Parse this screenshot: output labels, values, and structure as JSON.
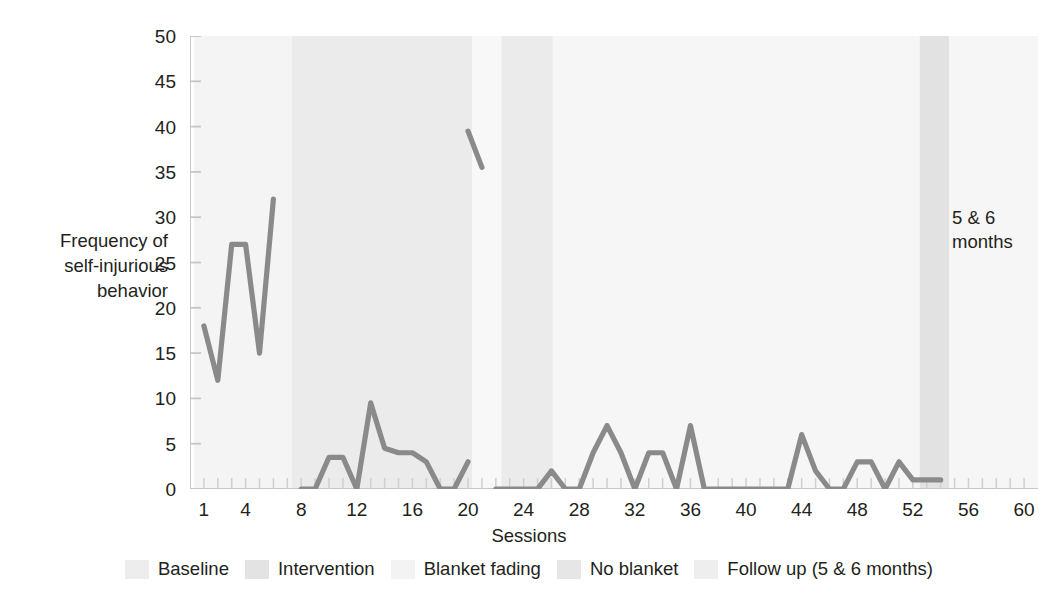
{
  "chart_data": {
    "type": "line",
    "title": "",
    "xlabel": "Sessions",
    "ylabel": "Frequency of\nself-injurious\nbehavior",
    "xlim": [
      0,
      61
    ],
    "ylim": [
      0,
      50
    ],
    "grid": false,
    "x_ticks": [
      1,
      4,
      8,
      12,
      16,
      20,
      24,
      28,
      32,
      36,
      40,
      44,
      48,
      52,
      56,
      60
    ],
    "y_ticks": [
      0,
      5,
      10,
      15,
      20,
      25,
      30,
      35,
      40,
      45,
      50
    ],
    "line_color": "#8a8a8a",
    "series": [
      {
        "name": "Baseline",
        "x": [
          1,
          2,
          3,
          4,
          5,
          6
        ],
        "values": [
          18,
          12,
          27,
          27,
          15,
          32
        ]
      },
      {
        "name": "Intervention",
        "x": [
          8,
          9,
          10,
          11,
          12,
          13,
          14,
          15,
          16,
          17,
          18,
          19,
          20
        ],
        "values": [
          0,
          0,
          3.5,
          3.5,
          0,
          9.5,
          4.5,
          4,
          4,
          3,
          0,
          0,
          3
        ]
      },
      {
        "name": "Spike segment",
        "x": [
          20,
          21
        ],
        "values": [
          39.5,
          35.5
        ]
      },
      {
        "name": "Blanket fading / No blanket",
        "x": [
          22,
          23,
          24,
          25,
          26,
          27,
          28,
          29,
          30,
          31,
          32,
          33,
          34,
          35,
          36,
          37,
          38,
          39,
          40,
          41,
          42,
          43,
          44,
          45,
          46,
          47,
          48,
          49,
          50,
          51,
          52,
          53,
          54
        ],
        "values": [
          0,
          0,
          0,
          0,
          2,
          0,
          0,
          4,
          7,
          4,
          0,
          4,
          4,
          0,
          7,
          0,
          0,
          0,
          0,
          0,
          0,
          0,
          6,
          2,
          0,
          0,
          3,
          3,
          0,
          3,
          1,
          1,
          1
        ]
      }
    ],
    "bands": [
      {
        "name": "Baseline",
        "x_start": 0.3,
        "x_end": 7.3,
        "color": "#f4f4f4"
      },
      {
        "name": "Intervention",
        "x_start": 7.3,
        "x_end": 20.3,
        "color": "#ebebeb"
      },
      {
        "name": "Blanket fading",
        "x_start": 20.3,
        "x_end": 22.4,
        "color": "#f8f8f8"
      },
      {
        "name": "No blanket",
        "x_start": 22.4,
        "x_end": 26.1,
        "color": "#ebebeb"
      },
      {
        "name": "Follow up (5 & 6 months) A",
        "x_start": 26.1,
        "x_end": 52.5,
        "color": "#f6f6f6"
      },
      {
        "name": "Follow up (5 & 6 months)",
        "x_start": 52.5,
        "x_end": 54.6,
        "color": "#e2e2e2"
      },
      {
        "name": "Post",
        "x_start": 54.6,
        "x_end": 61.0,
        "color": "#f6f6f6"
      }
    ],
    "annotations": [
      {
        "text": "5 & 6\nmonths",
        "x": 55.5,
        "y": 28
      }
    ],
    "legend": {
      "position": "bottom",
      "entries": [
        {
          "label": "Baseline",
          "color": "#ededed"
        },
        {
          "label": "Intervention",
          "color": "#e3e3e3"
        },
        {
          "label": "Blanket fading",
          "color": "#f3f3f3"
        },
        {
          "label": "No blanket",
          "color": "#e6e6e6"
        },
        {
          "label": "Follow up (5 & 6 months)",
          "color": "#eeeeee"
        }
      ]
    }
  }
}
